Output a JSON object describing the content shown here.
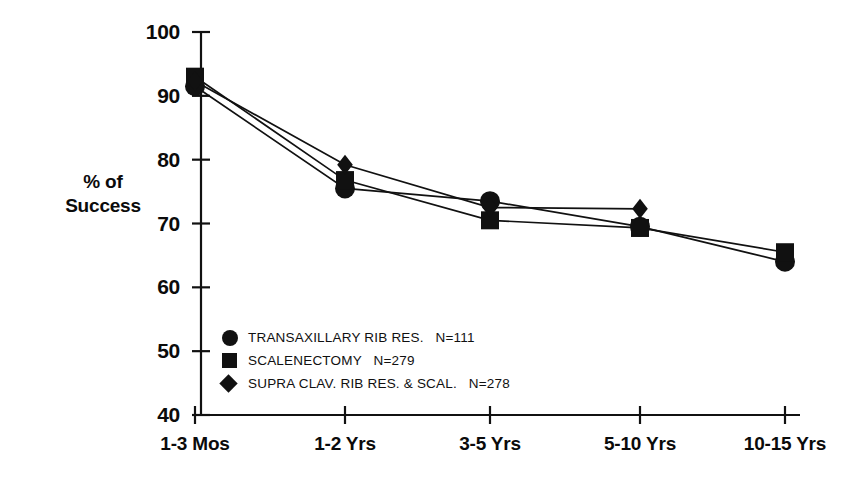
{
  "axis_title": {
    "line1": "% of",
    "line2": "Success"
  },
  "legend": {
    "items": [
      {
        "glyph": "circle-marker",
        "label": "TRANSAXILLARY RIB RES.",
        "n": "N=111"
      },
      {
        "glyph": "square-marker",
        "label": "SCALENECTOMY",
        "n": "N=279"
      },
      {
        "glyph": "diamond-marker",
        "label": "SUPRA CLAV. RIB RES. & SCAL.",
        "n": "N=278"
      }
    ]
  },
  "chart_data": {
    "type": "line",
    "title": "",
    "xlabel": "",
    "ylabel": "% of Success",
    "categories": [
      "1-3 Mos",
      "1-2 Yrs",
      "3-5 Yrs",
      "5-10 Yrs",
      "10-15 Yrs"
    ],
    "ylim": [
      40,
      100
    ],
    "yticks": [
      40,
      50,
      60,
      70,
      80,
      90,
      100
    ],
    "ytick_labels": [
      "40",
      "50",
      "60",
      "70",
      "80",
      "90",
      "100"
    ],
    "grid": false,
    "legend_position": "inside-lower-left",
    "series": [
      {
        "name": "TRANSAXILLARY RIB RES.",
        "n": 111,
        "marker": "circle",
        "values": [
          91.5,
          75.5,
          73.5,
          69.5,
          64.0
        ]
      },
      {
        "name": "SCALENECTOMY",
        "n": 279,
        "marker": "square",
        "values": [
          93.0,
          76.8,
          70.5,
          69.3,
          65.5
        ]
      },
      {
        "name": "SUPRA CLAV. RIB RES. & SCAL.",
        "n": 278,
        "marker": "diamond",
        "values": [
          92.3,
          79.2,
          72.5,
          72.3,
          null
        ]
      }
    ]
  }
}
